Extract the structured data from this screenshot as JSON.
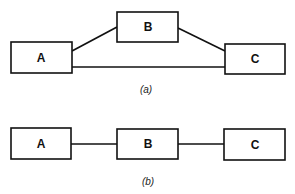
{
  "diagrams": [
    {
      "caption": "(a)",
      "nodes": [
        {
          "id": "A",
          "label": "A"
        },
        {
          "id": "B",
          "label": "B"
        },
        {
          "id": "C",
          "label": "C"
        }
      ],
      "edges": [
        {
          "from": "A",
          "to": "B"
        },
        {
          "from": "B",
          "to": "C"
        },
        {
          "from": "A",
          "to": "C"
        }
      ]
    },
    {
      "caption": "(b)",
      "nodes": [
        {
          "id": "A",
          "label": "A"
        },
        {
          "id": "B",
          "label": "B"
        },
        {
          "id": "C",
          "label": "C"
        }
      ],
      "edges": [
        {
          "from": "A",
          "to": "B"
        },
        {
          "from": "B",
          "to": "C"
        }
      ]
    }
  ]
}
